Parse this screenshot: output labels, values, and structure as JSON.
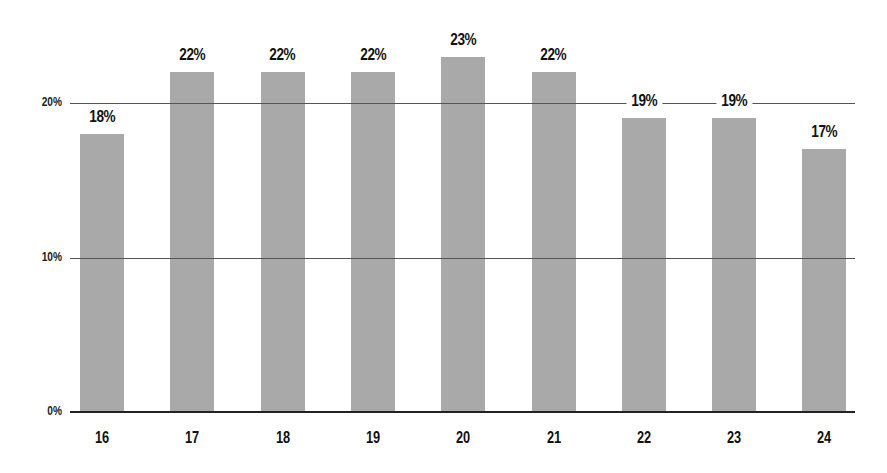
{
  "chart_data": {
    "type": "bar",
    "title": "",
    "xlabel": "",
    "ylabel": "",
    "categories": [
      "16",
      "17",
      "18",
      "19",
      "20",
      "21",
      "22",
      "23",
      "24"
    ],
    "values": [
      18,
      22,
      22,
      22,
      23,
      22,
      19,
      19,
      17
    ],
    "value_labels": [
      "18%",
      "22%",
      "22%",
      "22%",
      "23%",
      "22%",
      "19%",
      "19%",
      "17%"
    ],
    "yticks": [
      0,
      10,
      20
    ],
    "ytick_labels": [
      "0%",
      "10%",
      "20%"
    ],
    "ylim": [
      0,
      25
    ],
    "grid": true,
    "legend": null,
    "colors": {
      "bar": "#a9a9a9",
      "grid": "#555555",
      "axis": "#222222",
      "text": "#111111"
    }
  }
}
